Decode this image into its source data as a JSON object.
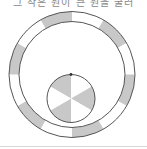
{
  "caption": "그 작은 원이 큰 원을 굴러",
  "colors": {
    "gray": "#c8c8c8",
    "white": "#ffffff",
    "stroke": "#555555",
    "rule": "#d8d8d8"
  },
  "diagram": {
    "outer_ring": {
      "center": [
        72,
        74.5
      ],
      "outer_radius": 63,
      "inner_radius": 53,
      "segments": 12,
      "pattern": [
        "gray",
        "white",
        "gray",
        "white",
        "gray",
        "white",
        "gray",
        "white",
        "gray",
        "white",
        "gray",
        "white"
      ],
      "start_angle_deg": -120
    },
    "inner_circle": {
      "center": [
        71,
        98.5
      ],
      "radius": 24,
      "sectors": 6,
      "pattern": [
        "gray",
        "white",
        "gray",
        "white",
        "gray",
        "white"
      ],
      "start_angle_deg": -150,
      "marker_dot": [
        71,
        74.5
      ]
    }
  }
}
